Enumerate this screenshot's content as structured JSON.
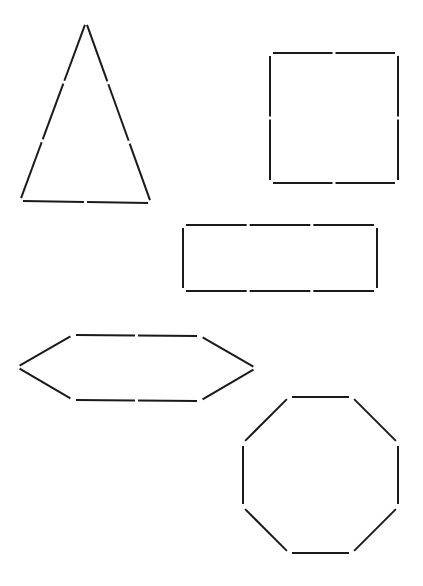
{
  "figure": {
    "width": 423,
    "height": 586,
    "stroke_color": "#1a1a1a",
    "background": "#ffffff",
    "gap_px": 3
  },
  "shapes": [
    {
      "id": "triangle",
      "name": "triangle",
      "vertices": [
        [
          86,
          22
        ],
        [
          151,
          203
        ],
        [
          20,
          201
        ]
      ],
      "segments_per_side": [
        3,
        2,
        3
      ]
    },
    {
      "id": "square",
      "name": "square",
      "vertices": [
        [
          270,
          53
        ],
        [
          398,
          53
        ],
        [
          398,
          183
        ],
        [
          270,
          183
        ]
      ],
      "segments_per_side": [
        2,
        2,
        2,
        2
      ]
    },
    {
      "id": "rectangle",
      "name": "rectangle",
      "vertices": [
        [
          183,
          225
        ],
        [
          377,
          225
        ],
        [
          377,
          291
        ],
        [
          183,
          291
        ]
      ],
      "segments_per_side": [
        3,
        1,
        3,
        1
      ]
    },
    {
      "id": "hexagon",
      "name": "hexagon",
      "vertices": [
        [
          17,
          367
        ],
        [
          73,
          335
        ],
        [
          200,
          336
        ],
        [
          256,
          368
        ],
        [
          200,
          401
        ],
        [
          73,
          400
        ]
      ],
      "segments_per_side": [
        1,
        2,
        1,
        1,
        2,
        1
      ]
    },
    {
      "id": "octagon",
      "name": "octagon",
      "vertices": [
        [
          289,
          397
        ],
        [
          352,
          397
        ],
        [
          398,
          443
        ],
        [
          398,
          507
        ],
        [
          352,
          553
        ],
        [
          289,
          553
        ],
        [
          243,
          507
        ],
        [
          243,
          443
        ]
      ],
      "segments_per_side": [
        1,
        1,
        1,
        1,
        1,
        1,
        1,
        1
      ]
    }
  ]
}
